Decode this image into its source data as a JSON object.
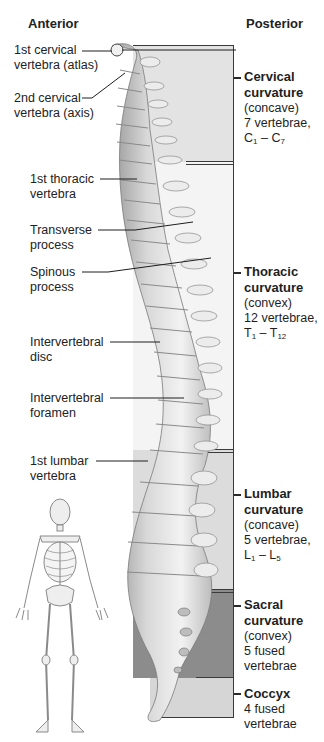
{
  "headings": {
    "anterior": "Anterior",
    "posterior": "Posterior"
  },
  "left_labels": [
    {
      "id": "atlas",
      "line1": "1st cervical",
      "line2": "vertebra (atlas)"
    },
    {
      "id": "axis",
      "line1": "2nd cervical",
      "line2": "vertebra (axis)"
    },
    {
      "id": "first-thoracic",
      "line1": "1st thoracic",
      "line2": "vertebra"
    },
    {
      "id": "transverse-process",
      "line1": "Transverse",
      "line2": "process"
    },
    {
      "id": "spinous-process",
      "line1": "Spinous",
      "line2": "process"
    },
    {
      "id": "intervertebral-disc",
      "line1": "Intervertebral",
      "line2": "disc"
    },
    {
      "id": "intervertebral-foramen",
      "line1": "Intervertebral",
      "line2": "foramen"
    },
    {
      "id": "first-lumbar",
      "line1": "1st lumbar",
      "line2": "vertebra"
    }
  ],
  "regions": [
    {
      "id": "cervical",
      "title_1": "Cervical",
      "title_2": "curvature",
      "shape": "(concave)",
      "count": "7 vertebrae,",
      "range_letter": "C",
      "range_start": "1",
      "range_sep": " – ",
      "range_end": "7",
      "color": "#e3e3e3"
    },
    {
      "id": "thoracic",
      "title_1": "Thoracic",
      "title_2": "curvature",
      "shape": "(convex)",
      "count": "12 vertebrae,",
      "range_letter": "T",
      "range_start": "1",
      "range_sep": " – ",
      "range_end": "12",
      "color": "#f4f4f4"
    },
    {
      "id": "lumbar",
      "title_1": "Lumbar",
      "title_2": "curvature",
      "shape": "(concave)",
      "count": "5 vertebrae,",
      "range_letter": "L",
      "range_start": "1",
      "range_sep": " – ",
      "range_end": "5",
      "color": "#dcdcdc"
    },
    {
      "id": "sacral",
      "title_1": "Sacral",
      "title_2": "curvature",
      "shape": "(convex)",
      "count_1": "5 fused",
      "count_2": "vertebrae",
      "color": "#8c8c8c"
    },
    {
      "id": "coccyx",
      "title_1": "Coccyx",
      "count_1": "4 fused",
      "count_2": "vertebrae",
      "color": "#d6d6d6"
    }
  ],
  "illustrations": {
    "spine": "spine-lateral-view",
    "skeleton": "full-skeleton-anterior-view"
  }
}
